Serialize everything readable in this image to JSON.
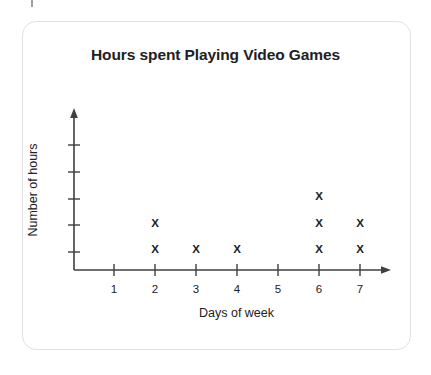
{
  "chart_data": {
    "type": "scatter",
    "title": "Hours spent Playing Video Games",
    "xlabel": "Days of week",
    "ylabel": "Number of hours",
    "categories": [
      "1",
      "2",
      "3",
      "4",
      "5",
      "6",
      "7"
    ],
    "values": [
      0,
      2,
      1,
      1,
      0,
      3,
      2
    ],
    "marker": "X",
    "grid": false,
    "legend": null,
    "xlim": [
      1,
      7
    ],
    "ylim": [
      0,
      5
    ],
    "x_tick_labels": [
      "1",
      "2",
      "3",
      "4",
      "5",
      "6",
      "7"
    ],
    "y_tick_labels": [
      "",
      "",
      "",
      "",
      ""
    ],
    "y_tick_count": 5,
    "points": [
      {
        "day": "2",
        "stack": 1
      },
      {
        "day": "2",
        "stack": 2
      },
      {
        "day": "3",
        "stack": 1
      },
      {
        "day": "4",
        "stack": 1
      },
      {
        "day": "6",
        "stack": 1
      },
      {
        "day": "6",
        "stack": 2
      },
      {
        "day": "6",
        "stack": 3
      },
      {
        "day": "7",
        "stack": 1
      },
      {
        "day": "7",
        "stack": 2
      }
    ]
  },
  "colors": {
    "axis": "#3c4043",
    "text": "#202124",
    "card_border": "#dfe1e5",
    "background": "#ffffff"
  }
}
